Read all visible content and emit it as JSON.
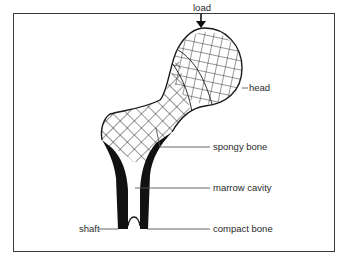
{
  "figure": {
    "labels": {
      "load": "load",
      "head": "head",
      "spongy_bone": "spongy bone",
      "marrow_cavity": "marrow cavity",
      "compact_bone": "compact bone",
      "shaft": "shaft"
    },
    "colors": {
      "ink": "#1a1a1a",
      "leader": "#555555",
      "frame": "#3a3a3a",
      "background": "#ffffff"
    }
  }
}
